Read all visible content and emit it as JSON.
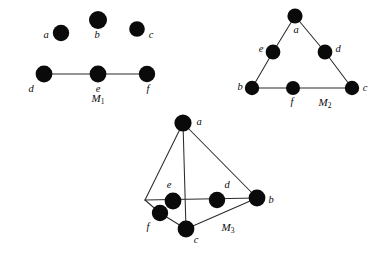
{
  "figure": {
    "background_color": "#ffffff",
    "node_color": "#0a0a0a",
    "edge_color": "#2b2b2b",
    "node_radius": 7.2
  },
  "graphs": [
    {
      "id": "M1",
      "caption_main": "M",
      "caption_sub": "1",
      "caption_x": 98,
      "caption_y": 99,
      "nodes": [
        {
          "id": "a",
          "label": "a",
          "cx": 61,
          "cy": 33,
          "lx": 46,
          "ly": 36,
          "anchor": "middle"
        },
        {
          "id": "b",
          "label": "b",
          "cx": 98,
          "cy": 20,
          "lx": 97,
          "ly": 36,
          "anchor": "middle"
        },
        {
          "id": "c",
          "label": "c",
          "cx": 137,
          "cy": 29,
          "lx": 151,
          "ly": 36,
          "anchor": "middle"
        },
        {
          "id": "d",
          "label": "d",
          "cx": 44,
          "cy": 74,
          "lx": 31,
          "ly": 90,
          "anchor": "middle"
        },
        {
          "id": "e",
          "label": "e",
          "cx": 98,
          "cy": 74,
          "lx": 98,
          "ly": 90,
          "anchor": "middle"
        },
        {
          "id": "f",
          "label": "f",
          "cx": 147,
          "cy": 74,
          "lx": 148,
          "ly": 90,
          "anchor": "middle"
        }
      ],
      "edges": [
        {
          "from": "d",
          "to": "e"
        },
        {
          "from": "e",
          "to": "f"
        }
      ]
    },
    {
      "id": "M2",
      "caption_main": "M",
      "caption_sub": "2",
      "caption_x": 325,
      "caption_y": 103,
      "nodes": [
        {
          "id": "a",
          "label": "a",
          "cx": 295,
          "cy": 16,
          "lx": 296,
          "ly": 31,
          "anchor": "middle"
        },
        {
          "id": "e",
          "label": "e",
          "cx": 273,
          "cy": 52,
          "lx": 261,
          "ly": 50,
          "anchor": "middle"
        },
        {
          "id": "d",
          "label": "d",
          "cx": 325,
          "cy": 52,
          "lx": 338,
          "ly": 50,
          "anchor": "middle"
        },
        {
          "id": "b",
          "label": "b",
          "cx": 252,
          "cy": 88,
          "lx": 240,
          "ly": 88,
          "anchor": "middle"
        },
        {
          "id": "f",
          "label": "f",
          "cx": 293,
          "cy": 88,
          "lx": 292,
          "ly": 103,
          "anchor": "middle"
        },
        {
          "id": "c",
          "label": "c",
          "cx": 352,
          "cy": 88,
          "lx": 365,
          "ly": 89,
          "anchor": "middle"
        }
      ],
      "edges": [
        {
          "from": "a",
          "to": "e"
        },
        {
          "from": "e",
          "to": "b"
        },
        {
          "from": "a",
          "to": "d"
        },
        {
          "from": "d",
          "to": "c"
        },
        {
          "from": "b",
          "to": "f"
        },
        {
          "from": "f",
          "to": "c"
        }
      ]
    },
    {
      "id": "M3",
      "caption_main": "M",
      "caption_sub": "3",
      "caption_x": 228,
      "caption_y": 228,
      "nodes": [
        {
          "id": "a",
          "label": "a",
          "cx": 183,
          "cy": 123,
          "lx": 199,
          "ly": 123,
          "anchor": "middle"
        },
        {
          "id": "e",
          "label": "e",
          "cx": 173,
          "cy": 201,
          "lx": 169,
          "ly": 186,
          "anchor": "middle"
        },
        {
          "id": "d",
          "label": "d",
          "cx": 217,
          "cy": 200,
          "lx": 227,
          "ly": 186,
          "anchor": "middle"
        },
        {
          "id": "b",
          "label": "b",
          "cx": 257,
          "cy": 198,
          "lx": 271,
          "ly": 201,
          "anchor": "middle"
        },
        {
          "id": "f",
          "label": "f",
          "cx": 160,
          "cy": 213,
          "lx": 148,
          "ly": 228,
          "anchor": "middle"
        },
        {
          "id": "c",
          "label": "c",
          "cx": 186,
          "cy": 229,
          "lx": 196,
          "ly": 241,
          "anchor": "middle"
        }
      ],
      "junction": {
        "x": 145,
        "y": 200
      },
      "edges": [
        {
          "from": "a",
          "to": "junction"
        },
        {
          "from": "a",
          "to": "c"
        },
        {
          "from": "a",
          "to": "b"
        },
        {
          "from": "junction",
          "to": "b"
        },
        {
          "from": "junction",
          "to": "f"
        },
        {
          "from": "f",
          "to": "c"
        },
        {
          "from": "c",
          "to": "b"
        }
      ]
    }
  ]
}
